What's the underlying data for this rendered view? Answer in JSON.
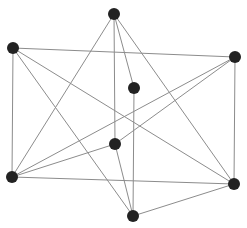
{
  "graph": {
    "node_color": "#222222",
    "edge_color": "#8c8c8c",
    "node_radius": 6,
    "nodes": [
      {
        "id": "top",
        "x": 114,
        "y": 14
      },
      {
        "id": "left-top",
        "x": 13,
        "y": 48
      },
      {
        "id": "right-top",
        "x": 235,
        "y": 57
      },
      {
        "id": "middle",
        "x": 134,
        "y": 88
      },
      {
        "id": "center-lower",
        "x": 115,
        "y": 144
      },
      {
        "id": "left-bottom",
        "x": 12,
        "y": 177
      },
      {
        "id": "right-bottom",
        "x": 234,
        "y": 184
      },
      {
        "id": "bottom",
        "x": 133,
        "y": 216
      }
    ],
    "edges": [
      [
        "top",
        "left-bottom"
      ],
      [
        "top",
        "center-lower"
      ],
      [
        "top",
        "middle"
      ],
      [
        "top",
        "right-bottom"
      ],
      [
        "left-top",
        "right-top"
      ],
      [
        "left-top",
        "left-bottom"
      ],
      [
        "left-top",
        "bottom"
      ],
      [
        "left-top",
        "right-bottom"
      ],
      [
        "right-top",
        "left-bottom"
      ],
      [
        "right-top",
        "center-lower"
      ],
      [
        "right-top",
        "right-bottom"
      ],
      [
        "middle",
        "bottom"
      ],
      [
        "center-lower",
        "left-bottom"
      ],
      [
        "center-lower",
        "bottom"
      ],
      [
        "left-bottom",
        "right-bottom"
      ],
      [
        "right-bottom",
        "bottom"
      ]
    ]
  }
}
